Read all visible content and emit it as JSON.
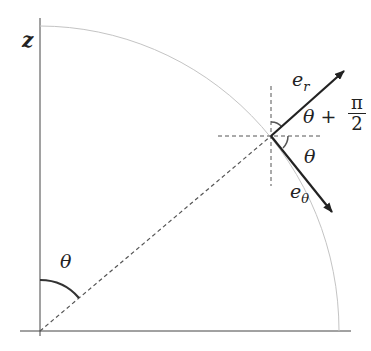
{
  "diagram": {
    "axis_label_z": "z",
    "angle_at_origin": "θ",
    "vector_r_label": "e",
    "vector_r_sub": "r",
    "vector_theta_label": "e",
    "vector_theta_sub": "θ",
    "angle_between_label": "θ +",
    "angle_between_num": "π",
    "angle_between_den": "2",
    "angle_below_label": "θ",
    "colors": {
      "line": "#222222",
      "arc": "#bbbbbb",
      "dash": "#555555"
    }
  }
}
